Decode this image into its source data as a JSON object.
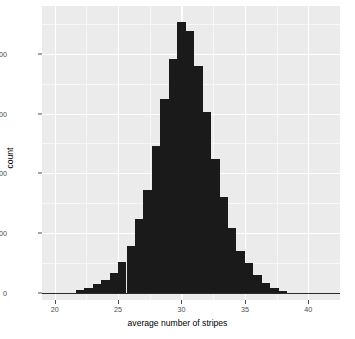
{
  "chart_data": {
    "type": "bar",
    "title": "",
    "subtitle": "",
    "xlabel": "average number of stripes",
    "ylabel": "count",
    "xlim": [
      19.0,
      42.5
    ],
    "ylim": [
      -60,
      2400
    ],
    "xticks": [
      20,
      25,
      30,
      35,
      40
    ],
    "xtick_labels": [
      "20",
      "25",
      "30",
      "35",
      "40"
    ],
    "yticks": [
      0,
      500,
      1000,
      1500,
      2000
    ],
    "ytick_labels": [
      "0",
      "500",
      "1000",
      "1500",
      "2000"
    ],
    "grid": true,
    "legend": null,
    "bar_color": "#1a1a1a",
    "panel_color": "#ebebeb",
    "gridline_color": "#ffffff",
    "bin_width": 0.667,
    "categories": [
      22.0,
      22.67,
      23.33,
      24.0,
      24.67,
      25.33,
      26.0,
      26.67,
      27.33,
      28.0,
      28.67,
      29.33,
      30.0,
      30.67,
      31.33,
      32.0,
      32.67,
      33.33,
      34.0,
      34.67,
      35.33,
      36.0,
      36.67,
      37.33,
      38.0
    ],
    "values": [
      20,
      40,
      75,
      110,
      170,
      255,
      390,
      620,
      860,
      1225,
      1620,
      1960,
      2270,
      2195,
      1900,
      1510,
      1120,
      800,
      545,
      350,
      250,
      150,
      80,
      40,
      15
    ]
  },
  "axes": {
    "y_label": "count",
    "x_label": "average number of stripes"
  }
}
